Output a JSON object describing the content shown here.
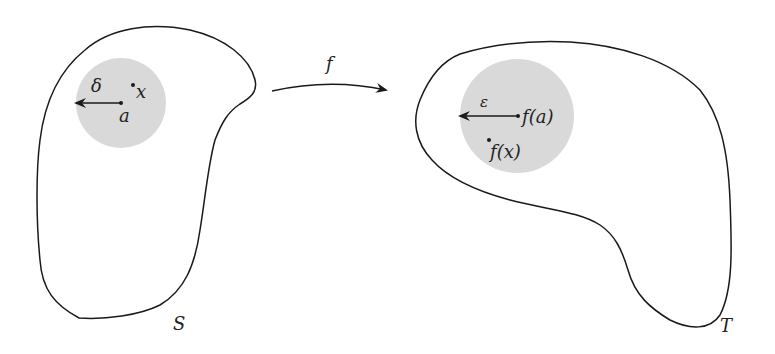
{
  "diagram": {
    "type": "continuity-epsilon-delta",
    "domain_set": {
      "label": "S",
      "ball": {
        "center_label": "a",
        "radius_label": "δ",
        "point_label": "x"
      }
    },
    "codomain_set": {
      "label": "T",
      "ball": {
        "center_label": "f(a)",
        "radius_label": "ε",
        "point_label": "f(x)"
      }
    },
    "map": {
      "label": "f"
    },
    "colors": {
      "outline": "#1a1a1a",
      "ball_fill": "#d9d9d9",
      "background": "#ffffff"
    }
  }
}
